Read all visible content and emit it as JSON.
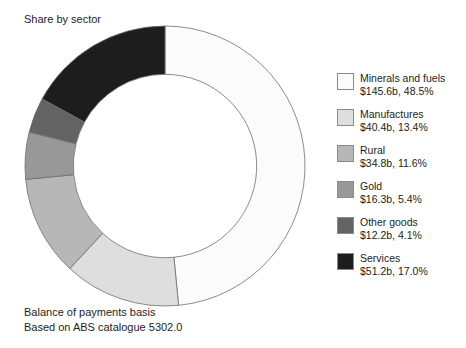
{
  "chart": {
    "title": "Share by sector",
    "footnote_line1": "Balance of payments basis",
    "footnote_line2": "Based on ABS catalogue 5302.0"
  },
  "chart_data": {
    "type": "pie",
    "variant": "donut",
    "title": "Share by sector",
    "annotations": [
      "Balance of payments basis",
      "Based on ABS catalogue 5302.0"
    ],
    "legend_position": "right",
    "value_unit": "$ billion",
    "start_angle_deg": 0,
    "direction": "clockwise",
    "inner_radius_ratio": 0.655,
    "categories": [
      "Minerals and fuels",
      "Manufactures",
      "Rural",
      "Gold",
      "Other goods",
      "Services"
    ],
    "values": [
      145.6,
      40.4,
      34.8,
      16.3,
      12.2,
      51.2
    ],
    "percentages": [
      48.5,
      13.4,
      11.6,
      5.4,
      4.1,
      17.0
    ],
    "colors": [
      "#fbfbfb",
      "#dedede",
      "#b7b7b7",
      "#989898",
      "#636363",
      "#1d1d1d"
    ],
    "slices": [
      {
        "label": "Minerals and fuels",
        "value": 145.6,
        "value_text": "$145.6b",
        "percent": 48.5,
        "percent_text": "48.5%",
        "color": "#fbfbfb"
      },
      {
        "label": "Manufactures",
        "value": 40.4,
        "value_text": "$40.4b",
        "percent": 13.4,
        "percent_text": "13.4%",
        "color": "#dedede"
      },
      {
        "label": "Rural",
        "value": 34.8,
        "value_text": "$34.8b",
        "percent": 11.6,
        "percent_text": "11.6%",
        "color": "#b7b7b7"
      },
      {
        "label": "Gold",
        "value": 16.3,
        "value_text": "$16.3b",
        "percent": 5.4,
        "percent_text": "5.4%",
        "color": "#989898"
      },
      {
        "label": "Other goods",
        "value": 12.2,
        "value_text": "$12.2b",
        "percent": 4.1,
        "percent_text": "4.1%",
        "color": "#636363"
      },
      {
        "label": "Services",
        "value": 51.2,
        "value_text": "$51.2b",
        "percent": 17.0,
        "percent_text": "17.0%",
        "color": "#1d1d1d"
      }
    ]
  },
  "legend": {
    "items": [
      {
        "label": "Minerals and fuels",
        "value_text": "$145.6b, 48.5%",
        "color": "#fbfbfb"
      },
      {
        "label": "Manufactures",
        "value_text": "$40.4b, 13.4%",
        "color": "#dedede"
      },
      {
        "label": "Rural",
        "value_text": "$34.8b, 11.6%",
        "color": "#b7b7b7"
      },
      {
        "label": "Gold",
        "value_text": "$16.3b, 5.4%",
        "color": "#989898"
      },
      {
        "label": "Other goods",
        "value_text": "$12.2b, 4.1%",
        "color": "#636363"
      },
      {
        "label": "Services",
        "value_text": "$51.2b, 17.0%",
        "color": "#1d1d1d"
      }
    ]
  }
}
